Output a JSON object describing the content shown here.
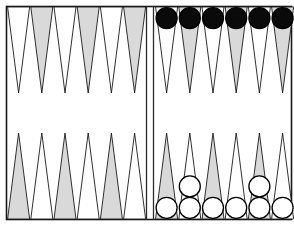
{
  "board": {
    "title": "Backgammon board",
    "width": 294,
    "height": 227,
    "frame": {
      "x": 6,
      "y": 6,
      "width": 286,
      "height": 214
    },
    "colors": {
      "background": "#ffffff",
      "point_light": "#ffffff",
      "point_dark": "#d9d9d9",
      "outline": "#1a1a1a",
      "checker_black_fill": "#0a0a0a",
      "checker_white_fill": "#ffffff",
      "checker_stroke": "#000000",
      "bar_line": "#2b2b2b"
    },
    "geometry": {
      "point_width": 23.2,
      "point_height": 86,
      "left_quadrant_x": 7,
      "right_quadrant_x": 155,
      "bar_line_1_x": 146,
      "bar_line_2_x": 153,
      "top_y": 7,
      "bottom_y": 219,
      "checker_radius": 11.2
    },
    "quadrants": [
      {
        "name": "top-left",
        "side": "top",
        "half": "left",
        "point_shades": [
          "light",
          "dark",
          "light",
          "dark",
          "light",
          "dark"
        ],
        "checkers": [
          {
            "count": 0,
            "color": "none"
          },
          {
            "count": 0,
            "color": "none"
          },
          {
            "count": 0,
            "color": "none"
          },
          {
            "count": 0,
            "color": "none"
          },
          {
            "count": 0,
            "color": "none"
          },
          {
            "count": 0,
            "color": "none"
          }
        ]
      },
      {
        "name": "top-right",
        "side": "top",
        "half": "right",
        "point_shades": [
          "light",
          "dark",
          "light",
          "dark",
          "light",
          "dark"
        ],
        "checkers": [
          {
            "count": 1,
            "color": "black"
          },
          {
            "count": 1,
            "color": "black"
          },
          {
            "count": 1,
            "color": "black"
          },
          {
            "count": 1,
            "color": "black"
          },
          {
            "count": 1,
            "color": "black"
          },
          {
            "count": 1,
            "color": "black"
          }
        ]
      },
      {
        "name": "bottom-left",
        "side": "bottom",
        "half": "left",
        "point_shades": [
          "dark",
          "light",
          "dark",
          "light",
          "dark",
          "light"
        ],
        "checkers": [
          {
            "count": 0,
            "color": "none"
          },
          {
            "count": 0,
            "color": "none"
          },
          {
            "count": 0,
            "color": "none"
          },
          {
            "count": 0,
            "color": "none"
          },
          {
            "count": 0,
            "color": "none"
          },
          {
            "count": 0,
            "color": "none"
          }
        ]
      },
      {
        "name": "bottom-right",
        "side": "bottom",
        "half": "right",
        "point_shades": [
          "dark",
          "light",
          "dark",
          "light",
          "dark",
          "light"
        ],
        "checkers": [
          {
            "count": 1,
            "color": "white"
          },
          {
            "count": 2,
            "color": "white"
          },
          {
            "count": 1,
            "color": "white"
          },
          {
            "count": 1,
            "color": "white"
          },
          {
            "count": 2,
            "color": "white"
          },
          {
            "count": 1,
            "color": "white"
          }
        ]
      }
    ],
    "totals": {
      "black_checkers": 6,
      "white_checkers": 8
    }
  }
}
